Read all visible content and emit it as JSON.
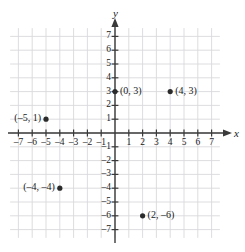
{
  "chart_data": {
    "type": "scatter",
    "title": "",
    "xlabel": "x",
    "ylabel": "y",
    "xlim": [
      -7.8,
      7.8
    ],
    "ylim": [
      -7.8,
      7.8
    ],
    "grid": true,
    "legend": "none",
    "x_ticks": [
      -7,
      -6,
      -5,
      -4,
      -3,
      -2,
      -1,
      1,
      2,
      3,
      4,
      5,
      6,
      7
    ],
    "y_ticks": [
      7,
      6,
      5,
      4,
      3,
      2,
      1,
      -1,
      -2,
      -3,
      -4,
      -5,
      -6,
      -7
    ],
    "x_tick_labels": [
      "–7",
      "–6",
      "–5",
      "–4",
      "–3",
      "–2",
      "–1",
      "1",
      "2",
      "3",
      "4",
      "5",
      "6",
      "7"
    ],
    "y_tick_labels": [
      "7",
      "6",
      "5",
      "4",
      "3",
      "2",
      "1",
      "–1",
      "–2",
      "–3",
      "–4",
      "–5",
      "–6",
      "–7"
    ],
    "points": [
      {
        "x": 0,
        "y": 3,
        "label": "(0, 3)",
        "label_side": "right"
      },
      {
        "x": 4,
        "y": 3,
        "label": "(4, 3)",
        "label_side": "right"
      },
      {
        "x": -5,
        "y": 1,
        "label": "(–5, 1)",
        "label_side": "left"
      },
      {
        "x": -4,
        "y": -4,
        "label": "(–4, –4)",
        "label_side": "left"
      },
      {
        "x": 2,
        "y": -6,
        "label": "(2, –6)",
        "label_side": "right"
      }
    ],
    "colors": {
      "grid": "#d9d9dd",
      "axis": "#3a3a3a",
      "point": "#2b2b2b",
      "text": "#1a1a1a",
      "background": "#ffffff"
    }
  },
  "axes": {
    "x_name": "x",
    "y_name": "y"
  }
}
